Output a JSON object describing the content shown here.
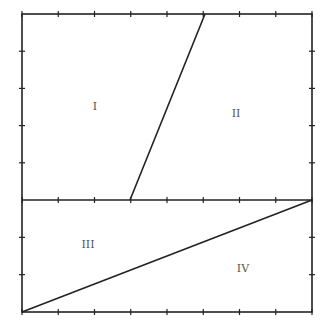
{
  "diagram": {
    "type": "geometric-figure",
    "stroke_color": "#222222",
    "label_color": "#555555",
    "outer_rectangle": {
      "x1": 22,
      "y1": 14,
      "x2": 312,
      "y2": 312
    },
    "divider_horizontal": {
      "x1": 22,
      "y1": 200,
      "x2": 312,
      "y2": 200
    },
    "upper_slant_segment": {
      "x1": 130,
      "y1": 200,
      "x2": 205,
      "y2": 14
    },
    "lower_diagonal": {
      "x1": 22,
      "y1": 312,
      "x2": 312,
      "y2": 200
    },
    "tick_spacing": 36.25,
    "horizontal_tick_count": 8,
    "upper_vertical_tick_count": 5,
    "lower_vertical_tick_count": 3,
    "regions": [
      {
        "id": "region-1",
        "label": "I",
        "x": 95,
        "y": 106
      },
      {
        "id": "region-2",
        "label": "II",
        "x": 236,
        "y": 113
      },
      {
        "id": "region-3",
        "label": "III",
        "x": 88,
        "y": 244
      },
      {
        "id": "region-4",
        "label": "IV",
        "x": 243,
        "y": 268
      }
    ]
  }
}
